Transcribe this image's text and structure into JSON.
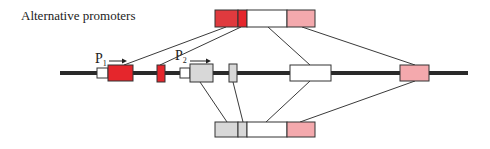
{
  "diagram": {
    "title": "Alternative promoters",
    "promoters": [
      {
        "label": "P",
        "subscript": "1"
      },
      {
        "label": "P",
        "subscript": "2"
      }
    ],
    "colors": {
      "exon_dark_red": "#e03a3e",
      "exon_red": "#e5262c",
      "exon_white": "#ffffff",
      "exon_pink": "#f4a9ad",
      "exon_grey": "#d8d8d8",
      "line": "#2a2a2a"
    },
    "transcripts": [
      {
        "name": "top-transcript",
        "from_promoter": "P1",
        "segments": [
          "dark-red",
          "red",
          "white",
          "pink"
        ]
      },
      {
        "name": "bottom-transcript",
        "from_promoter": "P2",
        "segments": [
          "grey",
          "grey",
          "white",
          "pink"
        ]
      }
    ]
  }
}
